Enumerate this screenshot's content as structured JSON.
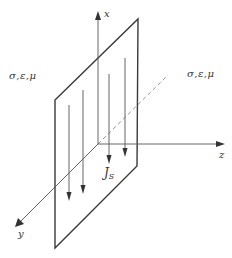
{
  "diagram": {
    "title": "",
    "colors": {
      "plate_edge": "#3a3a3a",
      "axis": "#555555",
      "current_arrow": "#555555",
      "dashed_axis": "#777777",
      "text": "#333333"
    },
    "medium_left": {
      "label": "σ,ε,μ"
    },
    "medium_right": {
      "label": "σ,ε,μ"
    },
    "axes": {
      "x": {
        "label": "x"
      },
      "y": {
        "label": "y"
      },
      "z": {
        "label": "z"
      }
    },
    "current": {
      "symbol": "J",
      "subscript": "S"
    },
    "plate": {
      "corners": [
        [
          55,
          100
        ],
        [
          138,
          19
        ],
        [
          137,
          166
        ],
        [
          55,
          248
        ]
      ]
    },
    "current_arrows": [
      {
        "x": 69,
        "y_top": 105,
        "y_tip": 200
      },
      {
        "x": 83,
        "y_top": 90,
        "y_tip": 193
      },
      {
        "x": 109,
        "y_top": 74,
        "y_tip": 163
      },
      {
        "x": 125,
        "y_top": 58,
        "y_tip": 156
      }
    ]
  }
}
